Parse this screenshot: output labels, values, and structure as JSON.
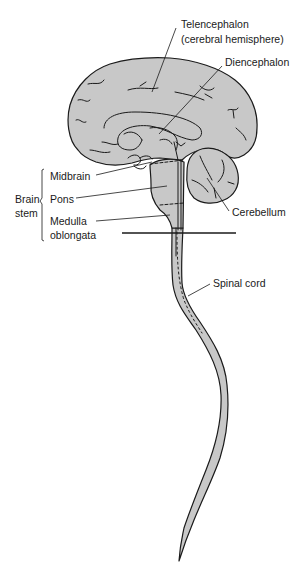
{
  "diagram": {
    "type": "anatomical-illustration",
    "colors": {
      "tissue_fill": "#c8c8c8",
      "outline": "#1a1a1a",
      "background": "#ffffff",
      "text": "#1a1a1a"
    },
    "labels": {
      "telencephalon_line1": "Telencephalon",
      "telencephalon_line2": "(cerebral hemisphere)",
      "diencephalon": "Diencephalon",
      "midbrain": "Midbrain",
      "pons": "Pons",
      "medulla_line1": "Medulla",
      "medulla_line2": "oblongata",
      "brain_stem_line1": "Brain",
      "brain_stem_line2": "stem",
      "cerebellum": "Cerebellum",
      "spinal_cord": "Spinal cord"
    },
    "groupings": [
      {
        "bracket": "brain-stem",
        "members": [
          "Midbrain",
          "Pons",
          "Medulla oblongata"
        ]
      }
    ]
  }
}
